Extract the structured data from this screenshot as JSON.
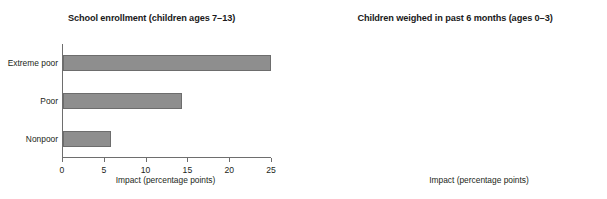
{
  "chart_data": [
    {
      "type": "bar",
      "orientation": "horizontal",
      "title": "School enrollment (children ages 7–13)",
      "categories": [
        "Extreme poor",
        "Poor",
        "Nonpoor"
      ],
      "values": [
        24.9,
        14.2,
        5.7
      ],
      "xlabel": "Impact (percentage points)",
      "ylabel": "",
      "xlim": [
        0,
        25
      ],
      "xticks": [
        0,
        5,
        10,
        15,
        20,
        25
      ],
      "xtick_labels": [
        "0",
        "5",
        "10",
        "15",
        "20",
        "25"
      ],
      "grid": false,
      "legend": false,
      "bar_color": "#8e8e8e",
      "bar_edge_color": "#6d6d6d",
      "axis_color": "#6e6e6e"
    },
    {
      "type": "bar",
      "orientation": "horizontal",
      "title": "Children weighed in past 6 months (ages 0–3)",
      "categories": [
        "Extreme poor",
        "Poor",
        "Nonpoor"
      ],
      "values": [
        21.1,
        7.6,
        9.2
      ],
      "xlabel": "Impact (percentage points)",
      "ylabel": "",
      "xlim": [
        0,
        30
      ],
      "xticks": [
        0,
        10,
        20,
        30
      ],
      "xtick_labels": [
        "0",
        "10",
        "20",
        "30"
      ],
      "grid": false,
      "legend": false,
      "bar_color": "#8e8e8e",
      "bar_edge_color": "#6d6d6d",
      "axis_color": "#6e6e6e"
    }
  ]
}
